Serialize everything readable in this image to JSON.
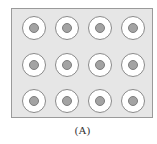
{
  "figure": {
    "label": "(A)",
    "grid": {
      "rows": 3,
      "cols": 4
    },
    "colors": {
      "panel_bg": "#e6e6e6",
      "panel_border": "#9a9a9a",
      "ring_fill": "#ffffff",
      "ring_border": "#8a8a8a",
      "core_fill": "#a3a3a3"
    }
  }
}
